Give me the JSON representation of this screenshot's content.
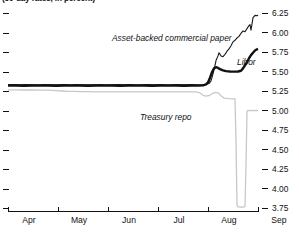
{
  "chart_data": {
    "type": "line",
    "title": "(30-day rates, in percent)",
    "xlabel": "",
    "ylabel": "",
    "ylim": [
      3.75,
      6.25
    ],
    "ytick_labels": [
      "6.25",
      "6.00",
      "5.75",
      "5.50",
      "5.25",
      "5.00",
      "4.75",
      "4.50",
      "4.25",
      "4.00",
      "3.75"
    ],
    "ytick_values": [
      6.25,
      6.0,
      5.75,
      5.5,
      5.25,
      5.0,
      4.75,
      4.5,
      4.25,
      4.0,
      3.75
    ],
    "xtick_labels": [
      "Apr",
      "May",
      "Jun",
      "Jul",
      "Aug",
      "Sep"
    ],
    "grid": false,
    "legend_position": "inline-annotations",
    "annotations": [
      {
        "text": "Asset-backed commercial paper",
        "x": 112,
        "y": 34
      },
      {
        "text": "Libor",
        "x": 237,
        "y": 58
      },
      {
        "text": "Treasury repo",
        "x": 140,
        "y": 113
      }
    ],
    "series": [
      {
        "name": "Asset-backed commercial paper",
        "color": "#1a1a1a",
        "width": 1.1,
        "points": [
          [
            8,
            5.33
          ],
          [
            14,
            5.332
          ],
          [
            20,
            5.329
          ],
          [
            26,
            5.333
          ],
          [
            32,
            5.331
          ],
          [
            38,
            5.33
          ],
          [
            45,
            5.334
          ],
          [
            52,
            5.331
          ],
          [
            58,
            5.329
          ],
          [
            64,
            5.333
          ],
          [
            70,
            5.33
          ],
          [
            76,
            5.332
          ],
          [
            82,
            5.329
          ],
          [
            88,
            5.331
          ],
          [
            94,
            5.33
          ],
          [
            100,
            5.333
          ],
          [
            106,
            5.331
          ],
          [
            112,
            5.329
          ],
          [
            118,
            5.332
          ],
          [
            124,
            5.33
          ],
          [
            130,
            5.333
          ],
          [
            136,
            5.331
          ],
          [
            142,
            5.329
          ],
          [
            148,
            5.332
          ],
          [
            154,
            5.33
          ],
          [
            160,
            5.333
          ],
          [
            166,
            5.331
          ],
          [
            172,
            5.329
          ],
          [
            178,
            5.332
          ],
          [
            184,
            5.33
          ],
          [
            190,
            5.333
          ],
          [
            196,
            5.331
          ],
          [
            202,
            5.329
          ],
          [
            206,
            5.335
          ],
          [
            209,
            5.345
          ],
          [
            211,
            5.38
          ],
          [
            213,
            5.47
          ],
          [
            215,
            5.58
          ],
          [
            216,
            5.64
          ],
          [
            218,
            5.7
          ],
          [
            219,
            5.74
          ],
          [
            221,
            5.7
          ],
          [
            223,
            5.69
          ],
          [
            225,
            5.72
          ],
          [
            227,
            5.76
          ],
          [
            229,
            5.79
          ],
          [
            231,
            5.83
          ],
          [
            233,
            5.88
          ],
          [
            235,
            5.9
          ],
          [
            237,
            5.93
          ],
          [
            239,
            5.95
          ],
          [
            241,
            5.99
          ],
          [
            243,
            6.02
          ],
          [
            245,
            6.01
          ],
          [
            247,
            6.05
          ],
          [
            249,
            6.09
          ],
          [
            250,
            6.1
          ],
          [
            251,
            6.03
          ],
          [
            253,
            6.19
          ],
          [
            255,
            6.22
          ],
          [
            257,
            6.215
          ],
          [
            258,
            6.225
          ]
        ]
      },
      {
        "name": "Libor",
        "color": "#111111",
        "width": 2.4,
        "points": [
          [
            8,
            5.32
          ],
          [
            16,
            5.32
          ],
          [
            24,
            5.318
          ],
          [
            32,
            5.32
          ],
          [
            40,
            5.319
          ],
          [
            48,
            5.32
          ],
          [
            56,
            5.318
          ],
          [
            64,
            5.32
          ],
          [
            72,
            5.319
          ],
          [
            80,
            5.32
          ],
          [
            88,
            5.318
          ],
          [
            96,
            5.32
          ],
          [
            104,
            5.319
          ],
          [
            112,
            5.32
          ],
          [
            120,
            5.318
          ],
          [
            128,
            5.32
          ],
          [
            136,
            5.319
          ],
          [
            144,
            5.32
          ],
          [
            152,
            5.318
          ],
          [
            160,
            5.32
          ],
          [
            168,
            5.319
          ],
          [
            176,
            5.32
          ],
          [
            184,
            5.318
          ],
          [
            192,
            5.32
          ],
          [
            198,
            5.319
          ],
          [
            203,
            5.322
          ],
          [
            206,
            5.335
          ],
          [
            208,
            5.36
          ],
          [
            210,
            5.42
          ],
          [
            212,
            5.49
          ],
          [
            214,
            5.54
          ],
          [
            216,
            5.555
          ],
          [
            218,
            5.545
          ],
          [
            220,
            5.53
          ],
          [
            223,
            5.515
          ],
          [
            226,
            5.505
          ],
          [
            230,
            5.5
          ],
          [
            234,
            5.498
          ],
          [
            238,
            5.5
          ],
          [
            241,
            5.51
          ],
          [
            243,
            5.54
          ],
          [
            245,
            5.58
          ],
          [
            247,
            5.62
          ],
          [
            249,
            5.67
          ],
          [
            251,
            5.71
          ],
          [
            253,
            5.74
          ],
          [
            255,
            5.77
          ],
          [
            257,
            5.785
          ],
          [
            258,
            5.79
          ]
        ]
      },
      {
        "name": "Treasury repo",
        "color": "#c8c8c8",
        "width": 1.3,
        "points": [
          [
            8,
            5.265
          ],
          [
            16,
            5.265
          ],
          [
            24,
            5.263
          ],
          [
            32,
            5.265
          ],
          [
            40,
            5.26
          ],
          [
            48,
            5.262
          ],
          [
            56,
            5.255
          ],
          [
            62,
            5.25
          ],
          [
            68,
            5.246
          ],
          [
            74,
            5.244
          ],
          [
            80,
            5.242
          ],
          [
            88,
            5.241
          ],
          [
            96,
            5.24
          ],
          [
            104,
            5.24
          ],
          [
            112,
            5.239
          ],
          [
            120,
            5.24
          ],
          [
            128,
            5.239
          ],
          [
            136,
            5.24
          ],
          [
            144,
            5.239
          ],
          [
            152,
            5.24
          ],
          [
            160,
            5.238
          ],
          [
            168,
            5.239
          ],
          [
            176,
            5.24
          ],
          [
            184,
            5.239
          ],
          [
            190,
            5.238
          ],
          [
            196,
            5.24
          ],
          [
            200,
            5.225
          ],
          [
            203,
            5.195
          ],
          [
            206,
            5.185
          ],
          [
            209,
            5.19
          ],
          [
            212,
            5.215
          ],
          [
            215,
            5.23
          ],
          [
            218,
            5.228
          ],
          [
            221,
            5.19
          ],
          [
            224,
            5.16
          ],
          [
            227,
            5.155
          ],
          [
            230,
            5.152
          ],
          [
            233,
            5.15
          ],
          [
            235,
            5.148
          ],
          [
            236,
            4.6
          ],
          [
            237,
            3.79
          ],
          [
            238,
            3.765
          ],
          [
            240,
            3.762
          ],
          [
            242,
            3.765
          ],
          [
            244,
            3.762
          ],
          [
            245,
            3.77
          ],
          [
            246,
            4.3
          ],
          [
            247,
            4.99
          ],
          [
            248,
            5.0
          ],
          [
            250,
            4.998
          ],
          [
            252,
            5.0
          ],
          [
            254,
            4.998
          ],
          [
            256,
            5.0
          ],
          [
            258,
            4.999
          ]
        ]
      }
    ]
  },
  "axes": {
    "left_dash_count": 11,
    "plot_left_px": 8,
    "plot_right_px": 258,
    "y_top_value": 6.25,
    "y_bottom_value": 3.75,
    "y_top_px": 13,
    "y_bottom_px": 208
  }
}
